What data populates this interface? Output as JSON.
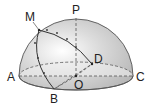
{
  "diagram": {
    "type": "hemisphere-geometry",
    "labels": {
      "P": "P",
      "M": "M",
      "D": "D",
      "A": "A",
      "C": "C",
      "O": "O",
      "B": "B"
    },
    "colors": {
      "surface": "#c9c9c9",
      "base": "#ececec",
      "stroke": "#444444"
    }
  }
}
